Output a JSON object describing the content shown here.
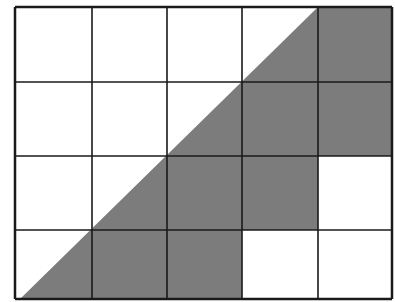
{
  "diagram": {
    "type": "grid-shading",
    "rows": 4,
    "cols": 5,
    "colors": {
      "background": "#ffffff",
      "shade": "#7c7c7c",
      "line": "#1a1a1a"
    },
    "grid_x": [
      15,
      92,
      167,
      242,
      318,
      392
    ],
    "grid_y": [
      7,
      82,
      156,
      230,
      299
    ],
    "shaded_cells": [
      {
        "row": 0,
        "col": 4
      },
      {
        "row": 1,
        "col": 3
      },
      {
        "row": 1,
        "col": 4
      },
      {
        "row": 2,
        "col": 2
      },
      {
        "row": 2,
        "col": 3
      },
      {
        "row": 3,
        "col": 1
      },
      {
        "row": 3,
        "col": 2
      }
    ],
    "diagonal": {
      "x1": 20,
      "y1": 299,
      "x2": 318,
      "y2": 7
    }
  }
}
